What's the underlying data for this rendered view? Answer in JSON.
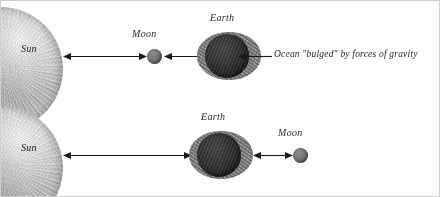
{
  "figure": {
    "background_color": "#fdfdfd",
    "border_color": "#cfcfcf",
    "width": 440,
    "height": 197
  },
  "panels": [
    {
      "id": "top",
      "description": "Sun, then Moon, then Earth in a line",
      "sun_label": "Sun",
      "moon_label": "Moon",
      "earth_label": "Earth",
      "order": [
        "Sun",
        "Moon",
        "Earth"
      ],
      "arrows": [
        {
          "name": "sun-to-moon-arrow",
          "heads": "both"
        },
        {
          "name": "moon-to-earth-arrow",
          "heads": "both"
        }
      ],
      "annotation": {
        "text": "Ocean \"bulged\" by forces of gravity",
        "points_to": "Earth"
      }
    },
    {
      "id": "bottom",
      "description": "Sun, then Earth, then Moon in a line",
      "sun_label": "Sun",
      "earth_label": "Earth",
      "moon_label": "Moon",
      "order": [
        "Sun",
        "Earth",
        "Moon"
      ],
      "arrows": [
        {
          "name": "sun-to-earth-arrow",
          "heads": "both"
        },
        {
          "name": "earth-to-moon-arrow",
          "heads": "both"
        }
      ]
    }
  ],
  "colors": {
    "sun_fill": "#c6c6c6",
    "earth_ocean_fill": "#7c7c7c",
    "earth_core_fill": "#2b2b2b",
    "moon_fill": "#6e6e6e",
    "arrow_stroke": "#1a1a1a",
    "text": "#262626"
  }
}
